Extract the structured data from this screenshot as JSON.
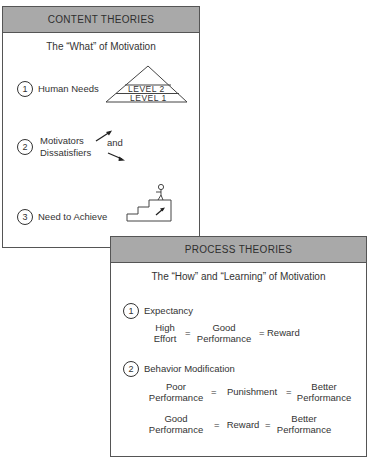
{
  "content_theories": {
    "title": "CONTENT THEORIES",
    "subtitle": "The “What” of Motivation",
    "items": [
      {
        "number": "1",
        "label": "Human Needs",
        "illustration": "pyramid",
        "pyramid_levels": [
          "LEVEL 2",
          "LEVEL 1"
        ]
      },
      {
        "number": "2",
        "label_lines": [
          "Motivators",
          "Dissatisfiers"
        ],
        "connector": "and",
        "illustration": "up-down-arrows"
      },
      {
        "number": "3",
        "label": "Need to Achieve",
        "illustration": "person-climbing-stairs"
      }
    ]
  },
  "process_theories": {
    "title": "PROCESS THEORIES",
    "subtitle": "The “How” and “Learning” of Motivation",
    "items": [
      {
        "number": "1",
        "label": "Expectancy",
        "equations": [
          {
            "terms": [
              [
                "High",
                "Effort"
              ],
              [
                "Good",
                "Performance"
              ],
              [
                "Reward"
              ]
            ],
            "operators": [
              "=",
              "="
            ]
          }
        ]
      },
      {
        "number": "2",
        "label": "Behavior Modification",
        "equations": [
          {
            "terms": [
              [
                "Poor",
                "Performance"
              ],
              [
                "Punishment"
              ],
              [
                "Better",
                "Performance"
              ]
            ],
            "operators": [
              "=",
              "="
            ]
          },
          {
            "terms": [
              [
                "Good",
                "Performance"
              ],
              [
                "Reward"
              ],
              [
                "Better",
                "Performance"
              ]
            ],
            "operators": [
              "=",
              "="
            ]
          }
        ]
      }
    ]
  },
  "colors": {
    "header_fill": "#a9a9a9",
    "border": "#555555",
    "text": "#2a2a2a"
  }
}
